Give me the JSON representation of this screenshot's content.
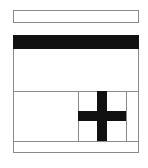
{
  "diagram": {
    "type": "wireframe-layout",
    "top_box": {
      "label": ""
    },
    "panel": {
      "header": {
        "label": ""
      },
      "content_area": {
        "label": ""
      },
      "lower_row": {
        "left_cell": {
          "label": ""
        },
        "middle_cell": {
          "icon": "plus-icon"
        },
        "right_cell": {
          "label": ""
        }
      },
      "footer_row": {
        "label": ""
      }
    },
    "colors": {
      "border": "#8a8a8a",
      "fill_dark": "#111111",
      "background": "#ffffff"
    }
  }
}
